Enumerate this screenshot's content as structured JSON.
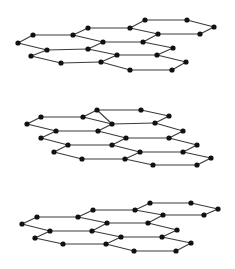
{
  "diagram": {
    "layer_count": 3,
    "colors": {
      "edge": "#3a3a3a",
      "node": "#111111",
      "background": "#ffffff"
    },
    "node_radius": 2.6,
    "layers": [
      {
        "name": "top-layer",
        "nodes": [
          [
            18,
            43
          ],
          [
            33,
            35
          ],
          [
            73,
            35
          ],
          [
            88,
            28
          ],
          [
            130,
            28
          ],
          [
            145,
            20
          ],
          [
            187,
            20
          ],
          [
            214,
            27
          ],
          [
            200,
            34
          ],
          [
            158,
            34
          ],
          [
            103,
            42
          ],
          [
            143,
            42
          ],
          [
            47,
            50
          ],
          [
            88,
            49
          ],
          [
            173,
            48
          ],
          [
            157,
            55
          ],
          [
            117,
            55
          ],
          [
            31,
            56
          ],
          [
            61,
            63
          ],
          [
            101,
            62
          ],
          [
            186,
            62
          ],
          [
            172,
            70
          ],
          [
            130,
            70
          ]
        ],
        "edges": [
          [
            0,
            1
          ],
          [
            1,
            2
          ],
          [
            2,
            3
          ],
          [
            3,
            4
          ],
          [
            4,
            5
          ],
          [
            5,
            6
          ],
          [
            6,
            7
          ],
          [
            7,
            8
          ],
          [
            8,
            9
          ],
          [
            9,
            4
          ],
          [
            2,
            10
          ],
          [
            10,
            11
          ],
          [
            11,
            9
          ],
          [
            0,
            12
          ],
          [
            12,
            13
          ],
          [
            13,
            10
          ],
          [
            11,
            14
          ],
          [
            14,
            15
          ],
          [
            15,
            16
          ],
          [
            16,
            13
          ],
          [
            12,
            17
          ],
          [
            17,
            18
          ],
          [
            18,
            19
          ],
          [
            19,
            16
          ],
          [
            15,
            20
          ],
          [
            20,
            21
          ],
          [
            21,
            22
          ],
          [
            22,
            19
          ]
        ]
      },
      {
        "name": "middle-layer",
        "nodes": [
          [
            27,
            124
          ],
          [
            41,
            117
          ],
          [
            83,
            117
          ],
          [
            97,
            110
          ],
          [
            141,
            110
          ],
          [
            169,
            116
          ],
          [
            155,
            123
          ],
          [
            112,
            124
          ],
          [
            56,
            131
          ],
          [
            98,
            131
          ],
          [
            126,
            138
          ],
          [
            169,
            138
          ],
          [
            183,
            131
          ],
          [
            41,
            138
          ],
          [
            68,
            145
          ],
          [
            112,
            145
          ],
          [
            197,
            145
          ],
          [
            183,
            152
          ],
          [
            140,
            152
          ],
          [
            54,
            152
          ],
          [
            82,
            159
          ],
          [
            125,
            159
          ],
          [
            153,
            165
          ],
          [
            197,
            165
          ],
          [
            211,
            158
          ]
        ],
        "edges": [
          [
            0,
            1
          ],
          [
            1,
            2
          ],
          [
            2,
            3
          ],
          [
            3,
            4
          ],
          [
            4,
            5
          ],
          [
            5,
            6
          ],
          [
            6,
            7
          ],
          [
            7,
            3
          ],
          [
            2,
            7
          ],
          [
            0,
            8
          ],
          [
            8,
            9
          ],
          [
            9,
            7
          ],
          [
            9,
            10
          ],
          [
            10,
            11
          ],
          [
            11,
            12
          ],
          [
            12,
            6
          ],
          [
            8,
            13
          ],
          [
            13,
            14
          ],
          [
            14,
            15
          ],
          [
            15,
            10
          ],
          [
            11,
            16
          ],
          [
            16,
            17
          ],
          [
            17,
            18
          ],
          [
            18,
            15
          ],
          [
            14,
            19
          ],
          [
            19,
            20
          ],
          [
            20,
            21
          ],
          [
            21,
            18
          ],
          [
            21,
            22
          ],
          [
            22,
            23
          ],
          [
            23,
            24
          ],
          [
            24,
            17
          ]
        ]
      },
      {
        "name": "bottom-layer",
        "nodes": [
          [
            22,
            224
          ],
          [
            37,
            217
          ],
          [
            78,
            217
          ],
          [
            93,
            210
          ],
          [
            135,
            210
          ],
          [
            150,
            203
          ],
          [
            191,
            203
          ],
          [
            218,
            209
          ],
          [
            204,
            215
          ],
          [
            163,
            215
          ],
          [
            107,
            223
          ],
          [
            148,
            223
          ],
          [
            50,
            231
          ],
          [
            92,
            231
          ],
          [
            177,
            230
          ],
          [
            162,
            237
          ],
          [
            121,
            237
          ],
          [
            35,
            238
          ],
          [
            63,
            244
          ],
          [
            106,
            244
          ],
          [
            191,
            243
          ],
          [
            176,
            251
          ],
          [
            134,
            251
          ]
        ],
        "edges": [
          [
            0,
            1
          ],
          [
            1,
            2
          ],
          [
            2,
            3
          ],
          [
            3,
            4
          ],
          [
            4,
            5
          ],
          [
            5,
            6
          ],
          [
            6,
            7
          ],
          [
            7,
            8
          ],
          [
            8,
            9
          ],
          [
            9,
            4
          ],
          [
            2,
            10
          ],
          [
            10,
            11
          ],
          [
            11,
            9
          ],
          [
            0,
            12
          ],
          [
            12,
            13
          ],
          [
            13,
            10
          ],
          [
            11,
            14
          ],
          [
            14,
            15
          ],
          [
            15,
            16
          ],
          [
            16,
            13
          ],
          [
            12,
            17
          ],
          [
            17,
            18
          ],
          [
            18,
            19
          ],
          [
            19,
            16
          ],
          [
            15,
            20
          ],
          [
            20,
            21
          ],
          [
            21,
            22
          ],
          [
            22,
            19
          ]
        ]
      }
    ]
  }
}
